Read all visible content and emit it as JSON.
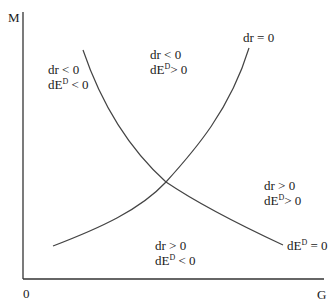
{
  "diagram": {
    "type": "phase-diagram",
    "axes": {
      "y_label": "M",
      "x_label": "G",
      "origin_label": "0"
    },
    "curves": [
      {
        "name": "dr-zero-locus",
        "label_base": "dr = 0",
        "slope": "upward"
      },
      {
        "name": "dE-zero-locus",
        "label_base": "dE",
        "label_sup": "D",
        "label_tail": " = 0",
        "slope": "downward"
      }
    ],
    "regions": {
      "left": {
        "line1": "dr < 0",
        "line2_base": "dE",
        "line2_sup": "D",
        "line2_tail": " < 0"
      },
      "top": {
        "line1": "dr < 0",
        "line2_base": "dE",
        "line2_sup": "D",
        "line2_tail": "> 0"
      },
      "right": {
        "line1": "dr > 0",
        "line2_base": "dE",
        "line2_sup": "D",
        "line2_tail": "> 0"
      },
      "bottom": {
        "line1": "dr > 0",
        "line2_base": "dE",
        "line2_sup": "D",
        "line2_tail": " < 0"
      }
    },
    "colors": {
      "axis": "#333333",
      "curve": "#444444",
      "text": "#1a1a1a"
    }
  }
}
